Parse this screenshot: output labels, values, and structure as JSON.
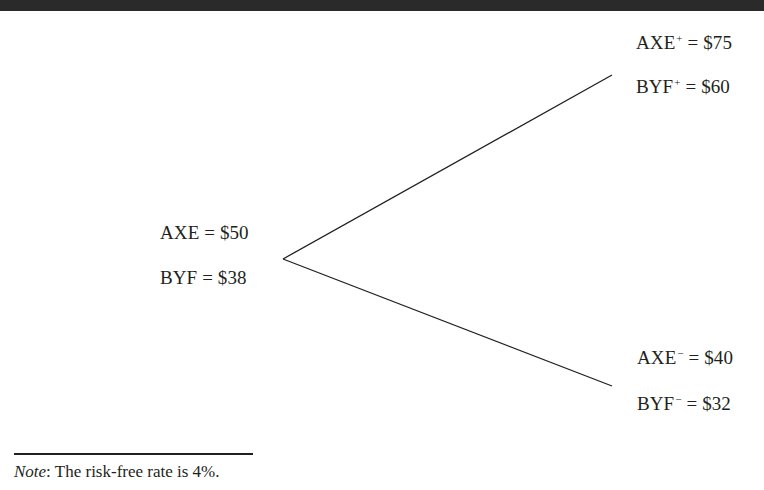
{
  "diagram": {
    "type": "binomial-tree",
    "root": {
      "labels": [
        {
          "name": "AXE",
          "superscript": "",
          "equals": "=",
          "value": "$50"
        },
        {
          "name": "BYF",
          "superscript": "",
          "equals": "=",
          "value": "$38"
        }
      ]
    },
    "up": {
      "labels": [
        {
          "name": "AXE",
          "superscript": "+",
          "equals": "=",
          "value": "$75"
        },
        {
          "name": "BYF",
          "superscript": "+",
          "equals": "=",
          "value": "$60"
        }
      ]
    },
    "down": {
      "labels": [
        {
          "name": "AXE",
          "superscript": "−",
          "equals": "=",
          "value": "$40"
        },
        {
          "name": "BYF",
          "superscript": "−",
          "equals": "=",
          "value": "$32"
        }
      ]
    },
    "edges": [
      {
        "from": "root",
        "to": "up"
      },
      {
        "from": "root",
        "to": "down"
      }
    ]
  },
  "note": {
    "prefix": "Note",
    "colon": ":",
    "text": " The risk-free rate is 4%."
  },
  "colors": {
    "ink": "#231f20",
    "top_bar": "#2a2a2a",
    "background": "#ffffff"
  }
}
